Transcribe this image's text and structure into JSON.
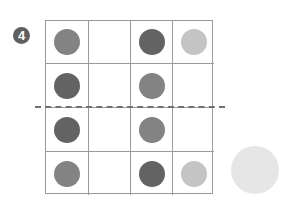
{
  "badge": {
    "label": "4"
  },
  "colors": {
    "dark": "#636363",
    "medium": "#838383",
    "light": "#c4c4c4",
    "very_light": "#e6e6e6",
    "grid_line": "#9a9a9a",
    "dash_line": "#707070"
  },
  "grid": {
    "rows": 4,
    "cols": 4,
    "cells": [
      [
        "medium",
        "empty",
        "dark",
        "light"
      ],
      [
        "dark",
        "empty",
        "medium",
        "empty"
      ],
      [
        "dark",
        "empty",
        "medium",
        "empty"
      ],
      [
        "medium",
        "empty",
        "dark",
        "light"
      ]
    ],
    "divider_after_row": 2
  },
  "outside_circle": {
    "color": "very_light"
  }
}
